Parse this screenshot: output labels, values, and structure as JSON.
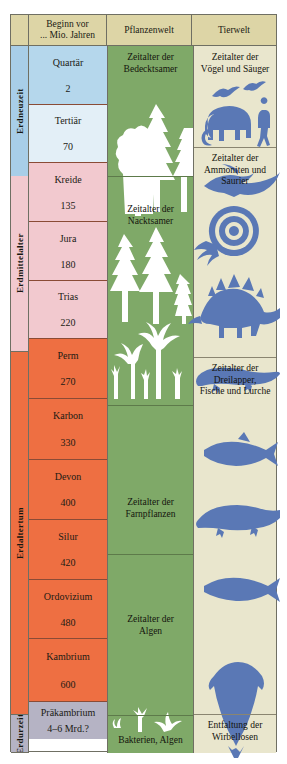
{
  "header": {
    "era_col": "",
    "period_col": "Beginn vor ... Mio. Jahren",
    "period_col_line1": "Beginn vor",
    "period_col_line2": "... Mio. Jahren",
    "plants_col": "Pflanzenwelt",
    "animals_col": "Tierwelt"
  },
  "colors": {
    "header_bg": "#ddd5a6",
    "erdneuzeit": "#a8cee8",
    "erdmittelalter": "#f2c9cf",
    "erdaltertum": "#ee6f42",
    "erdurzeit": "#b5b3c4",
    "quartaer": "#b5d7ec",
    "tertiaer": "#e3eff7",
    "plants_bg": "#7fa968",
    "animals_bg": "#e9e6cd",
    "silhouette_blue": "#5a78b5",
    "plant_white": "#ffffff",
    "border": "#6f6f63"
  },
  "chart_data": {
    "type": "table",
    "columns": [
      "",
      "Beginn vor ... Mio. Jahren",
      "Pflanzenwelt",
      "Tierwelt"
    ],
    "eras": [
      {
        "name": "Erdneuzeit",
        "color": "#a8cee8",
        "top": 0,
        "height": 130
      },
      {
        "name": "Erdmittelalter",
        "color": "#f2c9cf",
        "top": 130,
        "height": 176
      },
      {
        "name": "Erdaltertum",
        "color": "#ee6f42",
        "top": 306,
        "height": 363
      },
      {
        "name": "Erdurzeit",
        "color": "#b5b3c4",
        "top": 669,
        "height": 38
      }
    ],
    "periods": [
      {
        "name": "Quartär",
        "age": "2",
        "fill": "#b5d7ec",
        "top": 0,
        "height": 58
      },
      {
        "name": "Tertiär",
        "age": "70",
        "fill": "#e3eff7",
        "top": 58,
        "height": 58
      },
      {
        "name": "Kreide",
        "age": "135",
        "fill": "#f2c9cf",
        "top": 130,
        "height": 59
      },
      {
        "name": "Jura",
        "age": "180",
        "fill": "#f2c9cf",
        "top": 189,
        "height": 59
      },
      {
        "name": "Trias",
        "age": "220",
        "fill": "#f2c9cf",
        "top": 248,
        "height": 58
      },
      {
        "name": "Perm",
        "age": "270",
        "fill": "#ee6f42",
        "top": 306,
        "height": 60
      },
      {
        "name": "Karbon",
        "age": "330",
        "fill": "#ee6f42",
        "top": 366,
        "height": 61
      },
      {
        "name": "Devon",
        "age": "400",
        "fill": "#ee6f42",
        "top": 427,
        "height": 60
      },
      {
        "name": "Silur",
        "age": "420",
        "fill": "#ee6f42",
        "top": 487,
        "height": 60
      },
      {
        "name": "Ordovizium",
        "age": "480",
        "fill": "#ee6f42",
        "top": 547,
        "height": 59
      },
      {
        "name": "Kambrium",
        "age": "600",
        "fill": "#ee6f42",
        "top": 606,
        "height": 63
      },
      {
        "name": "Präkambrium",
        "age": "4–6 Mrd.?",
        "fill": "#b5b3c4",
        "top": 669,
        "height": 38
      }
    ],
    "plant_sections": [
      {
        "label": "Zeitalter der Bedecktsamer",
        "top": 0,
        "height": 130,
        "label_top": 6
      },
      {
        "label": "Zeitalter der Nacktsamer",
        "top": 130,
        "height": 229,
        "label_top": 28
      },
      {
        "label": "Zeitalter der Farnpflanzen",
        "top": 359,
        "height": 149,
        "label_top": 92
      },
      {
        "label": "Zeitalter der Algen",
        "top": 508,
        "height": 161,
        "label_top": 60
      },
      {
        "label": "Bakterien, Algen",
        "top": 669,
        "height": 38,
        "label_top": 20
      }
    ],
    "animal_sections": [
      {
        "label": "Zeitalter der Vögel und Säuger",
        "top": 0,
        "height": 101,
        "label_top": 6
      },
      {
        "label": "Zeitalter der Ammoniten und Saurier",
        "top": 101,
        "height": 210,
        "label_top": 6
      },
      {
        "label": "Zeitalter der Dreilapper, Fische und Lurche",
        "top": 311,
        "height": 357,
        "label_top": 6
      },
      {
        "label": "Entfaltung der Wirbellosen",
        "top": 668,
        "height": 39,
        "label_top": 6
      }
    ],
    "plant_labels_multiline": [
      [
        "Zeitalter der",
        "Bedecktsamer"
      ],
      [
        "Zeitalter der",
        "Nacktsamer"
      ],
      [
        "Zeitalter der",
        "Farnpflanzen"
      ],
      [
        "Zeitalter der",
        "Algen"
      ],
      [
        "Bakterien, Algen"
      ]
    ],
    "animal_labels_multiline": [
      [
        "Zeitalter der",
        "Vögel und Säuger"
      ],
      [
        "Zeitalter der",
        "Ammoniten und",
        "Saurier"
      ],
      [
        "Zeitalter der",
        "Dreilapper,",
        "Fische und Lurche"
      ],
      [
        "Entfaltung der",
        "Wirbellosen"
      ]
    ],
    "animal_icons": [
      "bird-silhouette",
      "bird-silhouette",
      "mammoth-silhouette",
      "human-silhouette",
      "pterosaur-silhouette",
      "ammonite-silhouette",
      "stegosaurus-silhouette",
      "amphibian-silhouette",
      "fish-silhouette",
      "crocodilian-silhouette",
      "fish-silhouette-2",
      "trilobite-silhouette"
    ],
    "plant_icons": [
      "deciduous-tree",
      "conifer-tree",
      "conifer-tree",
      "fern-tree",
      "palm-like-tree",
      "horsetail",
      "algae-strand",
      "bacteria-strand"
    ]
  }
}
